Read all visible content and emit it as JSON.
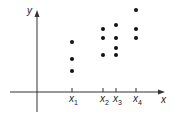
{
  "chart_data": {
    "type": "scatter",
    "title": "",
    "xlabel": "x",
    "ylabel": "y",
    "grid": false,
    "legend": null,
    "x_ticks": [
      {
        "label": "x",
        "sub": "1",
        "px": 72
      },
      {
        "label": "x",
        "sub": "2",
        "px": 103
      },
      {
        "label": "x",
        "sub": "3",
        "px": 116
      },
      {
        "label": "x",
        "sub": "4",
        "px": 136
      }
    ],
    "points": [
      {
        "x": "x1",
        "px": 72,
        "py": 42
      },
      {
        "x": "x1",
        "px": 72,
        "py": 59
      },
      {
        "x": "x1",
        "px": 72,
        "py": 71
      },
      {
        "x": "x2",
        "px": 103,
        "py": 29
      },
      {
        "x": "x2",
        "px": 103,
        "py": 38
      },
      {
        "x": "x2",
        "px": 103,
        "py": 55
      },
      {
        "x": "x3",
        "px": 116,
        "py": 25
      },
      {
        "x": "x3",
        "px": 116,
        "py": 38
      },
      {
        "x": "x3",
        "px": 116,
        "py": 48
      },
      {
        "x": "x3",
        "px": 116,
        "py": 55
      },
      {
        "x": "x4",
        "px": 136,
        "py": 10
      },
      {
        "x": "x4",
        "px": 136,
        "py": 29
      },
      {
        "x": "x4",
        "px": 136,
        "py": 38
      }
    ],
    "axes": {
      "origin_px": [
        37,
        92
      ],
      "x_axis": {
        "from": 10,
        "to": 165
      },
      "y_axis": {
        "from": 112,
        "to": 10
      }
    },
    "colors": {
      "axis": "#333333",
      "point": "#111111",
      "text": "#222222"
    }
  }
}
